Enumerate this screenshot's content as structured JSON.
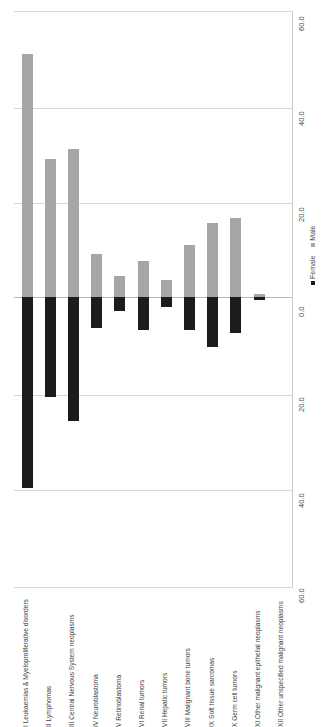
{
  "chart_data": {
    "type": "bar",
    "title": "",
    "subtitle": "",
    "xlabel": "",
    "ylabel": "",
    "orientation": "vertical",
    "stacked_diverging": true,
    "grid": true,
    "legend_position": "right",
    "ylim": [
      -60.0,
      60.0
    ],
    "yticks": [
      60.0,
      40.0,
      20.0,
      0.0,
      -20.0,
      -40.0,
      -60.0
    ],
    "ytick_labels": [
      "60.0",
      "40.0",
      "20.0",
      "0.0",
      "20.0",
      "40.0",
      "60.0"
    ],
    "categories": [
      "I Leukaemias & Myeloproliferative disorders",
      "II Lymphomas",
      "III Central Nervous System neoplasms",
      "IV Neuroblastoma",
      "V Retinoblastoma",
      "VI Renal tumors",
      "VII Hepatic tumors",
      "VIII Malignant bone tumors",
      "IX Soft tissue sarcomas",
      "X Germ cell tumors",
      "XI Other malignant epithelial neoplasms",
      "XII Other unspecified malignant neoplasms"
    ],
    "series": [
      {
        "name": "Male",
        "color": "#a6a6a6",
        "direction": "up",
        "values": [
          51.0,
          29.0,
          31.0,
          9.0,
          4.5,
          7.5,
          3.5,
          11.0,
          15.5,
          16.5,
          0.6,
          0.0
        ]
      },
      {
        "name": "Female",
        "color": "#1c1c1c",
        "direction": "down",
        "values": [
          40.0,
          21.0,
          26.0,
          6.5,
          3.0,
          7.0,
          2.0,
          7.0,
          10.5,
          7.5,
          0.6,
          0.0
        ]
      }
    ]
  },
  "legend": {
    "entries": [
      {
        "label": "Female",
        "color": "#1c1c1c"
      },
      {
        "label": "Male",
        "color": "#a6a6a6"
      }
    ]
  }
}
